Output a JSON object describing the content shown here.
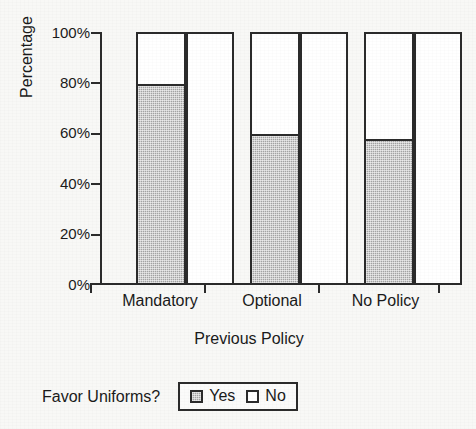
{
  "chart_data": {
    "type": "bar",
    "subtype": "grouped-100-percent",
    "title": "",
    "xlabel": "Previous Policy",
    "ylabel": "Percentage",
    "categories": [
      "Mandatory",
      "Optional",
      "No Policy"
    ],
    "series": [
      {
        "name": "Yes",
        "values": [
          80,
          60,
          58
        ],
        "color": "#a3a3a3"
      },
      {
        "name": "No",
        "values": [
          20,
          40,
          42
        ],
        "color": "#ffffff"
      }
    ],
    "ylim": [
      0,
      100
    ],
    "yticks": [
      0,
      20,
      40,
      60,
      80,
      100
    ],
    "ytick_labels": [
      "0%",
      "20%",
      "40%",
      "60%",
      "80%",
      "100%"
    ],
    "grid": false,
    "legend_position": "below-plot-center-left",
    "legend_title": "Favor Uniforms?",
    "legend_entries": [
      "Yes",
      "No"
    ],
    "axis_color": "#2b2b2b",
    "background_color": "#f8f8f6"
  },
  "axis": {
    "y_title": "Percentage",
    "x_title": "Previous Policy",
    "y_tick_labels": [
      "100%",
      "80%",
      "60%",
      "40%",
      "20%",
      "0%"
    ],
    "x_tick_labels": [
      "Mandatory",
      "Optional",
      "No Policy"
    ]
  },
  "legend": {
    "title": "Favor Uniforms?",
    "items": [
      {
        "label": "Yes",
        "swatch": "gray-square-icon"
      },
      {
        "label": "No",
        "swatch": "white-square-icon"
      }
    ]
  }
}
